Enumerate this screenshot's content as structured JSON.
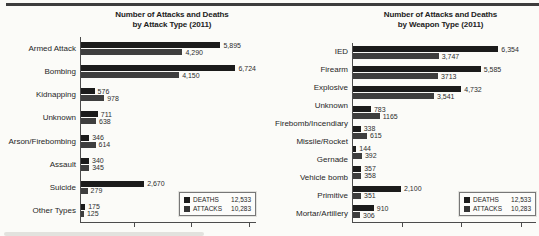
{
  "page": {
    "kind": "scanned report figure",
    "top_rule_color": "#3d3d3d",
    "background": "#fbfbf8"
  },
  "colors": {
    "deaths_bar": "#1b1b1b",
    "attacks_bar": "#3e3e3e",
    "axis": "#4c4c4c",
    "text": "#262626"
  },
  "chart_data": [
    {
      "type": "bar",
      "orientation": "horizontal",
      "title": "Number of Attacks and Deaths by Attack Type (2011)",
      "title_line1": "Number of Attacks and Deaths",
      "title_line2": "by Attack Type (2011)",
      "categories": [
        "Armed Attack",
        "Bombing",
        "Kidnapping",
        "Unknown",
        "Arson/Firebombing",
        "Assault",
        "Suicide",
        "Other Types"
      ],
      "series": [
        {
          "name": "DEATHS",
          "values": [
            5895,
            6724,
            576,
            711,
            346,
            340,
            2670,
            175
          ],
          "labels": [
            "5,895",
            "6,724",
            "576",
            "711",
            "346",
            "340",
            "2,670",
            "175"
          ]
        },
        {
          "name": "ATTACKS",
          "values": [
            4290,
            4150,
            978,
            638,
            614,
            345,
            279,
            125
          ],
          "labels": [
            "4,290",
            "4,150",
            "978",
            "638",
            "614",
            "345",
            "279",
            "125"
          ]
        }
      ],
      "legend": [
        {
          "label": "DEATHS",
          "total": "12,533"
        },
        {
          "label": "ATTACKS",
          "total": "10,283"
        }
      ],
      "legend_position": "bottom-right inside plot",
      "xlabel": "",
      "ylabel": "",
      "xmax": 7400,
      "grid": false,
      "axis_tick_positions_pct": [
        30,
        63,
        96
      ],
      "axis_tick_labels": []
    },
    {
      "type": "bar",
      "orientation": "horizontal",
      "title": "Number of Attacks and Deaths by Weapon Type (2011)",
      "title_line1": "Number of Attacks and Deaths",
      "title_line2": "by Weapon Type (2011)",
      "categories": [
        "IED",
        "Firearm",
        "Explosive",
        "Unknown",
        "Firebomb/Incendiary",
        "Missile/Rocket",
        "Gernade",
        "Vehicle bomb",
        "Primitive",
        "Mortar/Artillery"
      ],
      "series": [
        {
          "name": "DEATHS",
          "values": [
            6354,
            5585,
            4732,
            783,
            338,
            144,
            357,
            2100,
            910
          ],
          "labels": [
            "6,354",
            "5,585",
            "4,732",
            "783",
            "338",
            "144",
            "357",
            "2,100",
            "910"
          ]
        },
        {
          "name": "ATTACKS",
          "values": [
            3747,
            3713,
            3541,
            1165,
            615,
            392,
            358,
            351,
            306
          ],
          "labels": [
            "3,747",
            "3713",
            "3,541",
            "1165",
            "615",
            "392",
            "358",
            "351",
            "306"
          ]
        }
      ],
      "note": "source scan shows 10 category labels beside 9 visible bar pairs; labels drift slightly relative to bars",
      "legend": [
        {
          "label": "DEATHS",
          "total": "12,533"
        },
        {
          "label": "ATTACKS",
          "total": "10,283"
        }
      ],
      "legend_position": "bottom-right inside plot",
      "xlabel": "",
      "ylabel": "",
      "xmax": 8000,
      "grid": false,
      "axis_tick_positions_pct": [
        27,
        59,
        92
      ],
      "axis_tick_labels": []
    }
  ]
}
